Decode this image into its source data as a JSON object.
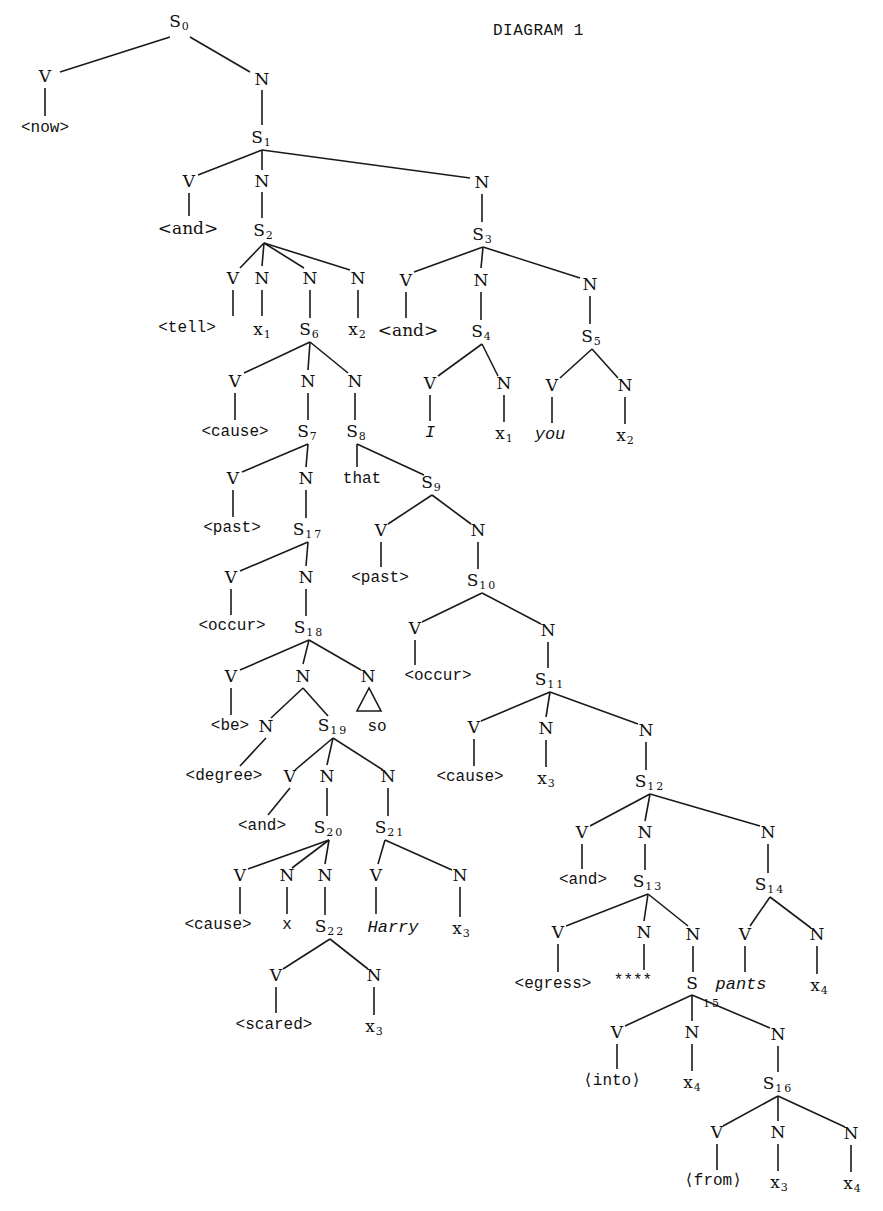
{
  "title": "DIAGRAM 1",
  "nodes": [
    {
      "id": "S0",
      "t": "S",
      "sub": "0",
      "x": 180,
      "y": 22
    },
    {
      "id": "V0",
      "t": "V",
      "x": 45,
      "y": 76
    },
    {
      "id": "N0",
      "t": "N",
      "x": 262,
      "y": 79
    },
    {
      "id": "now",
      "t": "<now>",
      "x": 45,
      "y": 128,
      "cls": "mono"
    },
    {
      "id": "S1",
      "t": "S",
      "sub": "1",
      "x": 262,
      "y": 138
    },
    {
      "id": "V1",
      "t": "V",
      "x": 189,
      "y": 181
    },
    {
      "id": "N1a",
      "t": "N",
      "x": 262,
      "y": 181
    },
    {
      "id": "N1b",
      "t": "N",
      "x": 482,
      "y": 182
    },
    {
      "id": "and1",
      "t": "<and>",
      "x": 188,
      "y": 228
    },
    {
      "id": "S2",
      "t": "S",
      "sub": "2",
      "x": 264,
      "y": 231
    },
    {
      "id": "S3",
      "t": "S",
      "sub": "3",
      "x": 483,
      "y": 235
    },
    {
      "id": "V2",
      "t": "V",
      "x": 233,
      "y": 278
    },
    {
      "id": "N2a",
      "t": "N",
      "x": 262,
      "y": 278
    },
    {
      "id": "N2b",
      "t": "N",
      "x": 310,
      "y": 278
    },
    {
      "id": "N2c",
      "t": "N",
      "x": 358,
      "y": 278
    },
    {
      "id": "V3",
      "t": "V",
      "x": 406,
      "y": 280
    },
    {
      "id": "N3a",
      "t": "N",
      "x": 481,
      "y": 280
    },
    {
      "id": "N3b",
      "t": "N",
      "x": 590,
      "y": 284
    },
    {
      "id": "tell",
      "t": "<tell>",
      "x": 187,
      "y": 328,
      "cls": "mono"
    },
    {
      "id": "x1a",
      "t": "x",
      "sub": "1",
      "x": 263,
      "y": 330
    },
    {
      "id": "S6",
      "t": "S",
      "sub": "6",
      "x": 310,
      "y": 330
    },
    {
      "id": "x2a",
      "t": "x",
      "sub": "2",
      "x": 358,
      "y": 330
    },
    {
      "id": "and3",
      "t": "<and>",
      "x": 408,
      "y": 330
    },
    {
      "id": "S4",
      "t": "S",
      "sub": "4",
      "x": 482,
      "y": 332
    },
    {
      "id": "S5",
      "t": "S",
      "sub": "5",
      "x": 592,
      "y": 337
    },
    {
      "id": "V6",
      "t": "V",
      "x": 235,
      "y": 381
    },
    {
      "id": "N6a",
      "t": "N",
      "x": 308,
      "y": 381
    },
    {
      "id": "N6b",
      "t": "N",
      "x": 355,
      "y": 381
    },
    {
      "id": "V4",
      "t": "V",
      "x": 430,
      "y": 383
    },
    {
      "id": "N4",
      "t": "N",
      "x": 504,
      "y": 383
    },
    {
      "id": "V5",
      "t": "V",
      "x": 552,
      "y": 385
    },
    {
      "id": "N5",
      "t": "N",
      "x": 625,
      "y": 385
    },
    {
      "id": "cause1",
      "t": "<cause>",
      "x": 235,
      "y": 432,
      "cls": "mono"
    },
    {
      "id": "S7",
      "t": "S",
      "sub": "7",
      "x": 308,
      "y": 432
    },
    {
      "id": "S8",
      "t": "S",
      "sub": "8",
      "x": 357,
      "y": 432
    },
    {
      "id": "I",
      "t": "I",
      "x": 430,
      "y": 432,
      "cls": "ital"
    },
    {
      "id": "x1b",
      "t": "x",
      "sub": "1",
      "x": 505,
      "y": 434
    },
    {
      "id": "you",
      "t": "you",
      "x": 550,
      "y": 434,
      "cls": "ital"
    },
    {
      "id": "x2b",
      "t": "x",
      "sub": "2",
      "x": 626,
      "y": 436
    },
    {
      "id": "V7",
      "t": "V",
      "x": 233,
      "y": 478
    },
    {
      "id": "N7",
      "t": "N",
      "x": 306,
      "y": 478
    },
    {
      "id": "that",
      "t": "that",
      "x": 362,
      "y": 479,
      "cls": "mono"
    },
    {
      "id": "S9",
      "t": "S",
      "sub": "9",
      "x": 432,
      "y": 483
    },
    {
      "id": "past1",
      "t": "<past>",
      "x": 232,
      "y": 528,
      "cls": "mono"
    },
    {
      "id": "S17",
      "t": "S",
      "sub": "17",
      "x": 308,
      "y": 530
    },
    {
      "id": "V9",
      "t": "V",
      "x": 381,
      "y": 530
    },
    {
      "id": "N9",
      "t": "N",
      "x": 478,
      "y": 530
    },
    {
      "id": "V17",
      "t": "V",
      "x": 231,
      "y": 577
    },
    {
      "id": "N17",
      "t": "N",
      "x": 306,
      "y": 577
    },
    {
      "id": "past2",
      "t": "<past>",
      "x": 380,
      "y": 578,
      "cls": "mono"
    },
    {
      "id": "S10",
      "t": "S",
      "sub": "10",
      "x": 482,
      "y": 581
    },
    {
      "id": "occur1",
      "t": "<occur>",
      "x": 232,
      "y": 626,
      "cls": "mono"
    },
    {
      "id": "S18",
      "t": "S",
      "sub": "18",
      "x": 309,
      "y": 628
    },
    {
      "id": "V10",
      "t": "V",
      "x": 415,
      "y": 628
    },
    {
      "id": "N10",
      "t": "N",
      "x": 548,
      "y": 630
    },
    {
      "id": "V18",
      "t": "V",
      "x": 231,
      "y": 676
    },
    {
      "id": "N18a",
      "t": "N",
      "x": 303,
      "y": 676
    },
    {
      "id": "N18b",
      "t": "N",
      "x": 368,
      "y": 676
    },
    {
      "id": "occur2",
      "t": "<occur>",
      "x": 438,
      "y": 676,
      "cls": "mono"
    },
    {
      "id": "S11",
      "t": "S",
      "sub": "11",
      "x": 550,
      "y": 680
    },
    {
      "id": "be",
      "t": "<be>",
      "x": 230,
      "y": 726,
      "cls": "mono"
    },
    {
      "id": "N18c",
      "t": "N",
      "x": 266,
      "y": 726
    },
    {
      "id": "S19",
      "t": "S",
      "sub": "19",
      "x": 333,
      "y": 726
    },
    {
      "id": "so",
      "t": "so",
      "x": 377,
      "y": 727,
      "cls": "mono"
    },
    {
      "id": "V11",
      "t": "V",
      "x": 474,
      "y": 727
    },
    {
      "id": "N11a",
      "t": "N",
      "x": 546,
      "y": 728
    },
    {
      "id": "N11b",
      "t": "N",
      "x": 646,
      "y": 730
    },
    {
      "id": "degree",
      "t": "<degree>",
      "x": 224,
      "y": 776,
      "cls": "mono"
    },
    {
      "id": "V19",
      "t": "V",
      "x": 290,
      "y": 776
    },
    {
      "id": "N19a",
      "t": "N",
      "x": 327,
      "y": 776
    },
    {
      "id": "N19b",
      "t": "N",
      "x": 388,
      "y": 776
    },
    {
      "id": "cause2",
      "t": "<cause>",
      "x": 470,
      "y": 777,
      "cls": "mono"
    },
    {
      "id": "x3a",
      "t": "x",
      "sub": "3",
      "x": 547,
      "y": 779
    },
    {
      "id": "S12",
      "t": "S",
      "sub": "12",
      "x": 650,
      "y": 782
    },
    {
      "id": "and19",
      "t": "<and>",
      "x": 262,
      "y": 826,
      "cls": "mono"
    },
    {
      "id": "S20",
      "t": "S",
      "sub": "20",
      "x": 329,
      "y": 828
    },
    {
      "id": "S21",
      "t": "S",
      "sub": "21",
      "x": 390,
      "y": 828
    },
    {
      "id": "V12",
      "t": "V",
      "x": 582,
      "y": 832
    },
    {
      "id": "N12a",
      "t": "N",
      "x": 645,
      "y": 832
    },
    {
      "id": "N12b",
      "t": "N",
      "x": 768,
      "y": 832
    },
    {
      "id": "V20",
      "t": "V",
      "x": 240,
      "y": 875
    },
    {
      "id": "N20a",
      "t": "N",
      "x": 287,
      "y": 875
    },
    {
      "id": "N20b",
      "t": "N",
      "x": 325,
      "y": 875
    },
    {
      "id": "V21",
      "t": "V",
      "x": 376,
      "y": 875
    },
    {
      "id": "N21",
      "t": "N",
      "x": 460,
      "y": 875
    },
    {
      "id": "and12",
      "t": "<and>",
      "x": 583,
      "y": 880,
      "cls": "mono"
    },
    {
      "id": "S13",
      "t": "S",
      "sub": "13",
      "x": 648,
      "y": 882
    },
    {
      "id": "S14",
      "t": "S",
      "sub": "14",
      "x": 770,
      "y": 885
    },
    {
      "id": "cause3",
      "t": "<cause>",
      "x": 218,
      "y": 925,
      "cls": "mono"
    },
    {
      "id": "x20",
      "t": "x",
      "x": 287,
      "y": 925,
      "cls": "mono"
    },
    {
      "id": "S22",
      "t": "S",
      "sub": "22",
      "x": 330,
      "y": 927
    },
    {
      "id": "Harry",
      "t": "Harry",
      "x": 393,
      "y": 927,
      "cls": "ital"
    },
    {
      "id": "x3b",
      "t": "x",
      "sub": "3",
      "x": 462,
      "y": 929
    },
    {
      "id": "V13",
      "t": "V",
      "x": 558,
      "y": 932
    },
    {
      "id": "N13a",
      "t": "N",
      "x": 644,
      "y": 932
    },
    {
      "id": "N13b",
      "t": "N",
      "x": 693,
      "y": 934
    },
    {
      "id": "V14",
      "t": "V",
      "x": 745,
      "y": 934
    },
    {
      "id": "N14",
      "t": "N",
      "x": 817,
      "y": 934
    },
    {
      "id": "V22",
      "t": "V",
      "x": 276,
      "y": 975
    },
    {
      "id": "N22",
      "t": "N",
      "x": 374,
      "y": 975
    },
    {
      "id": "egress",
      "t": "<egress>",
      "x": 553,
      "y": 984,
      "cls": "mono"
    },
    {
      "id": "stars",
      "t": "****",
      "x": 633,
      "y": 981,
      "cls": "mono"
    },
    {
      "id": "S15",
      "t": "S",
      "sub": "",
      "x": 692,
      "y": 983
    },
    {
      "id": "sub15",
      "t": "15",
      "x": 712,
      "y": 1003,
      "cls": "small"
    },
    {
      "id": "pants",
      "t": "pants",
      "x": 741,
      "y": 984,
      "cls": "ital"
    },
    {
      "id": "x4a",
      "t": "x",
      "sub": "4",
      "x": 820,
      "y": 986
    },
    {
      "id": "scared",
      "t": "<scared>",
      "x": 274,
      "y": 1025,
      "cls": "mono"
    },
    {
      "id": "x3c",
      "t": "x",
      "sub": "3",
      "x": 375,
      "y": 1027
    },
    {
      "id": "V15",
      "t": "V",
      "x": 617,
      "y": 1032
    },
    {
      "id": "N15a",
      "t": "N",
      "x": 692,
      "y": 1032
    },
    {
      "id": "N15b",
      "t": "N",
      "x": 778,
      "y": 1034
    },
    {
      "id": "into",
      "t": "⟨into⟩",
      "x": 612,
      "y": 1081,
      "cls": "mono"
    },
    {
      "id": "x4b",
      "t": "x",
      "sub": "4",
      "x": 693,
      "y": 1083
    },
    {
      "id": "S16",
      "t": "S",
      "sub": "16",
      "x": 778,
      "y": 1084
    },
    {
      "id": "V16",
      "t": "V",
      "x": 717,
      "y": 1132
    },
    {
      "id": "N16a",
      "t": "N",
      "x": 778,
      "y": 1132
    },
    {
      "id": "N16b",
      "t": "N",
      "x": 851,
      "y": 1133
    },
    {
      "id": "from",
      "t": "⟨from⟩",
      "x": 713,
      "y": 1181,
      "cls": "mono"
    },
    {
      "id": "x3d",
      "t": "x",
      "sub": "3",
      "x": 780,
      "y": 1183
    },
    {
      "id": "x4c",
      "t": "x",
      "sub": "4",
      "x": 853,
      "y": 1184
    }
  ],
  "edges": [
    [
      170,
      37,
      60,
      72
    ],
    [
      190,
      37,
      250,
      72
    ],
    [
      45,
      88,
      45,
      116
    ],
    [
      262,
      90,
      262,
      125
    ],
    [
      262,
      150,
      198,
      175
    ],
    [
      262,
      150,
      262,
      170
    ],
    [
      262,
      150,
      470,
      178
    ],
    [
      189,
      193,
      189,
      216
    ],
    [
      262,
      192,
      262,
      218
    ],
    [
      482,
      194,
      482,
      222
    ],
    [
      264,
      243,
      240,
      268
    ],
    [
      264,
      243,
      262,
      266
    ],
    [
      264,
      243,
      304,
      268
    ],
    [
      264,
      243,
      350,
      270
    ],
    [
      483,
      247,
      414,
      272
    ],
    [
      483,
      247,
      481,
      268
    ],
    [
      483,
      247,
      580,
      278
    ],
    [
      233,
      290,
      233,
      316
    ],
    [
      262,
      290,
      262,
      316
    ],
    [
      310,
      290,
      310,
      318
    ],
    [
      358,
      290,
      358,
      318
    ],
    [
      406,
      292,
      406,
      318
    ],
    [
      481,
      292,
      481,
      320
    ],
    [
      590,
      296,
      590,
      324
    ],
    [
      310,
      342,
      244,
      373
    ],
    [
      310,
      342,
      308,
      370
    ],
    [
      310,
      342,
      348,
      373
    ],
    [
      482,
      344,
      438,
      376
    ],
    [
      482,
      344,
      498,
      376
    ],
    [
      592,
      349,
      560,
      378
    ],
    [
      592,
      349,
      618,
      378
    ],
    [
      235,
      393,
      235,
      420
    ],
    [
      308,
      393,
      308,
      420
    ],
    [
      355,
      393,
      355,
      420
    ],
    [
      430,
      395,
      430,
      421
    ],
    [
      504,
      395,
      504,
      422
    ],
    [
      552,
      397,
      552,
      423
    ],
    [
      625,
      397,
      625,
      424
    ],
    [
      308,
      444,
      242,
      472
    ],
    [
      308,
      444,
      306,
      467
    ],
    [
      357,
      444,
      357,
      467
    ],
    [
      357,
      444,
      424,
      475
    ],
    [
      233,
      490,
      233,
      517
    ],
    [
      306,
      490,
      306,
      518
    ],
    [
      432,
      495,
      388,
      524
    ],
    [
      432,
      495,
      471,
      524
    ],
    [
      308,
      542,
      240,
      571
    ],
    [
      308,
      542,
      306,
      566
    ],
    [
      381,
      542,
      381,
      567
    ],
    [
      478,
      542,
      478,
      569
    ],
    [
      231,
      589,
      231,
      615
    ],
    [
      306,
      589,
      306,
      616
    ],
    [
      482,
      593,
      422,
      622
    ],
    [
      482,
      593,
      541,
      624
    ],
    [
      309,
      640,
      240,
      670
    ],
    [
      309,
      640,
      303,
      664
    ],
    [
      309,
      640,
      361,
      670
    ],
    [
      415,
      640,
      415,
      665
    ],
    [
      548,
      642,
      548,
      668
    ],
    [
      231,
      688,
      231,
      715
    ],
    [
      303,
      688,
      271,
      718
    ],
    [
      303,
      688,
      328,
      716
    ],
    [
      550,
      692,
      481,
      721
    ],
    [
      550,
      692,
      546,
      717
    ],
    [
      550,
      692,
      638,
      724
    ],
    [
      266,
      738,
      240,
      766
    ],
    [
      333,
      738,
      295,
      770
    ],
    [
      333,
      738,
      327,
      765
    ],
    [
      333,
      738,
      383,
      770
    ],
    [
      474,
      739,
      474,
      766
    ],
    [
      546,
      740,
      546,
      767
    ],
    [
      646,
      742,
      646,
      770
    ],
    [
      290,
      788,
      268,
      815
    ],
    [
      327,
      788,
      327,
      816
    ],
    [
      388,
      788,
      388,
      816
    ],
    [
      650,
      794,
      590,
      826
    ],
    [
      650,
      794,
      645,
      821
    ],
    [
      650,
      794,
      760,
      826
    ],
    [
      582,
      844,
      582,
      869
    ],
    [
      645,
      844,
      645,
      870
    ],
    [
      768,
      844,
      768,
      873
    ],
    [
      329,
      840,
      248,
      869
    ],
    [
      329,
      840,
      292,
      868
    ],
    [
      329,
      840,
      325,
      864
    ],
    [
      385,
      840,
      378,
      864
    ],
    [
      385,
      840,
      452,
      870
    ],
    [
      648,
      894,
      566,
      926
    ],
    [
      648,
      894,
      644,
      921
    ],
    [
      648,
      894,
      688,
      926
    ],
    [
      770,
      897,
      750,
      926
    ],
    [
      770,
      897,
      811,
      928
    ],
    [
      240,
      887,
      240,
      914
    ],
    [
      287,
      887,
      287,
      914
    ],
    [
      325,
      887,
      325,
      915
    ],
    [
      376,
      887,
      376,
      914
    ],
    [
      460,
      887,
      460,
      917
    ],
    [
      558,
      944,
      558,
      972
    ],
    [
      644,
      944,
      644,
      970
    ],
    [
      693,
      946,
      693,
      972
    ],
    [
      745,
      946,
      745,
      972
    ],
    [
      817,
      946,
      817,
      974
    ],
    [
      330,
      939,
      283,
      969
    ],
    [
      330,
      939,
      368,
      969
    ],
    [
      276,
      987,
      276,
      1013
    ],
    [
      374,
      987,
      374,
      1015
    ],
    [
      692,
      995,
      625,
      1026
    ],
    [
      692,
      995,
      692,
      1021
    ],
    [
      692,
      995,
      770,
      1028
    ],
    [
      617,
      1044,
      617,
      1069
    ],
    [
      692,
      1044,
      692,
      1071
    ],
    [
      778,
      1046,
      778,
      1072
    ],
    [
      778,
      1096,
      723,
      1126
    ],
    [
      778,
      1096,
      778,
      1121
    ],
    [
      778,
      1096,
      845,
      1127
    ],
    [
      717,
      1144,
      717,
      1170
    ],
    [
      778,
      1144,
      778,
      1171
    ],
    [
      851,
      1145,
      851,
      1172
    ]
  ],
  "triangle": {
    "points": "369,688 357,711 381,711"
  }
}
